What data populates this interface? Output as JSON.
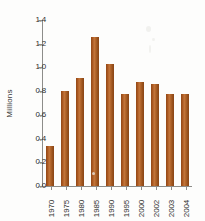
{
  "chart_data": {
    "type": "bar",
    "title": "",
    "subtitle": "",
    "xlabel": "",
    "ylabel": "Millions",
    "categories": [
      "1970",
      "1975",
      "1980",
      "1985",
      "1990",
      "1995",
      "2000",
      "2002",
      "2003",
      "2004"
    ],
    "values": [
      0.34,
      0.8,
      0.91,
      1.26,
      1.03,
      0.78,
      0.88,
      0.86,
      0.78,
      0.78
    ],
    "series": [
      {
        "name": "Millions",
        "values": [
          0.34,
          0.8,
          0.91,
          1.26,
          1.03,
          0.78,
          0.88,
          0.86,
          0.78,
          0.78
        ]
      }
    ],
    "ylim": [
      0.0,
      1.4
    ],
    "ytick_labels": [
      "0.0",
      "0.2",
      "0.4",
      "0.6",
      "0.8",
      "1.0",
      "1.2",
      "1.4"
    ],
    "ytick_values": [
      0.0,
      0.2,
      0.4,
      0.6,
      0.8,
      1.0,
      1.2,
      1.4
    ],
    "grid": false,
    "legend": false,
    "legend_position": "none",
    "bar_color": "#a8561f",
    "axis_color": "#8d8d8a",
    "background_color": "#fdfdfc",
    "text_color": "#2f2f2e",
    "xtick_rotation": 90,
    "annotations": []
  }
}
